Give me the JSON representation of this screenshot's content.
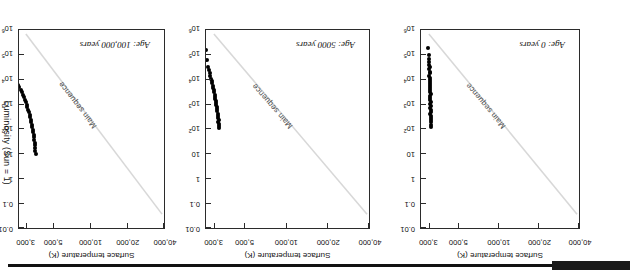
{
  "figure": {
    "kind": "hertzsprung-russell-diagram-series",
    "caption_visible": false,
    "scan_edge_color": "#111111",
    "point_color": "#000000",
    "main_sequence_line_color": "#d8d8d8",
    "frame_color": "#2b2b2b"
  },
  "axes": {
    "temperature": {
      "title": "Surface temperature (K)",
      "ticks": [
        "40,000",
        "20,000",
        "10,000",
        "5,000",
        "3,000"
      ],
      "direction": "decreasing-left-to-right"
    },
    "luminosity": {
      "title": "Luminosity (Sun = 1)",
      "ticks": [
        "0.01",
        "0.1",
        "1",
        "10",
        "10²",
        "10³",
        "10⁴",
        "10⁵",
        "10⁶"
      ],
      "tick_bases": [
        "0.01",
        "0.1",
        "1",
        "10",
        "10",
        "10",
        "10",
        "10",
        "10"
      ],
      "tick_exponents": [
        "",
        "",
        "",
        "",
        "2",
        "3",
        "4",
        "5",
        "6"
      ],
      "direction": "increasing-downward"
    }
  },
  "main_sequence_label": "Main sequence",
  "panels": [
    {
      "id": "panel-0",
      "age_label": "Age: 0 years",
      "order": 1
    },
    {
      "id": "panel-5000",
      "age_label": "Age: 5000 years",
      "order": 2
    },
    {
      "id": "panel-100k",
      "age_label": "Age: 100,000 years",
      "order": 3
    }
  ],
  "chart_data": {
    "type": "scatter",
    "xlabel": "Surface temperature (K)",
    "ylabel": "Luminosity (Sun = 1)",
    "x_ticklabels": [
      "40,000",
      "20,000",
      "10,000",
      "5,000",
      "3,000"
    ],
    "x_tickvalues": [
      40000,
      20000,
      10000,
      5000,
      3000
    ],
    "x_scale": "log-reversed",
    "xlim": [
      40000,
      2600
    ],
    "y_ticklabels": [
      "0.01",
      "0.1",
      "1",
      "10",
      "10^2",
      "10^3",
      "10^4",
      "10^5",
      "10^6"
    ],
    "y_tickvalues": [
      0.01,
      0.1,
      1,
      10,
      100,
      1000,
      10000,
      100000,
      1000000
    ],
    "y_scale": "log",
    "ylim": [
      0.01,
      1000000
    ],
    "grid": false,
    "legend": null,
    "annotations": [
      "Main sequence",
      "Age: 0 years",
      "Age: 5000 years",
      "Age: 100,000 years"
    ],
    "reference_line": {
      "name": "Main sequence",
      "from": {
        "temperature": 40000,
        "luminosity": 0.02
      },
      "to": {
        "temperature": 2900,
        "luminosity": 500000
      }
    },
    "series": [
      {
        "name": "Age: 0 years",
        "panel": "panel-0",
        "points": [
          {
            "temperature": 3100,
            "luminosity": 120
          },
          {
            "temperature": 3100,
            "luminosity": 150
          },
          {
            "temperature": 3080,
            "luminosity": 190
          },
          {
            "temperature": 3090,
            "luminosity": 230
          },
          {
            "temperature": 3070,
            "luminosity": 280
          },
          {
            "temperature": 3100,
            "luminosity": 330
          },
          {
            "temperature": 3060,
            "luminosity": 400
          },
          {
            "temperature": 3080,
            "luminosity": 470
          },
          {
            "temperature": 3090,
            "luminosity": 560
          },
          {
            "temperature": 3050,
            "luminosity": 680
          },
          {
            "temperature": 3070,
            "luminosity": 820
          },
          {
            "temperature": 3060,
            "luminosity": 980
          },
          {
            "temperature": 3080,
            "luminosity": 1200
          },
          {
            "temperature": 3040,
            "luminosity": 1450
          },
          {
            "temperature": 3060,
            "luminosity": 1750
          },
          {
            "temperature": 3050,
            "luminosity": 2100
          },
          {
            "temperature": 3070,
            "luminosity": 2550
          },
          {
            "temperature": 3030,
            "luminosity": 3100
          },
          {
            "temperature": 3050,
            "luminosity": 3750
          },
          {
            "temperature": 3040,
            "luminosity": 4500
          },
          {
            "temperature": 3060,
            "luminosity": 5400
          },
          {
            "temperature": 3020,
            "luminosity": 6600
          },
          {
            "temperature": 3040,
            "luminosity": 8000
          },
          {
            "temperature": 3030,
            "luminosity": 9700
          },
          {
            "temperature": 3050,
            "luminosity": 11800
          },
          {
            "temperature": 3010,
            "luminosity": 14300
          },
          {
            "temperature": 3030,
            "luminosity": 17500
          },
          {
            "temperature": 3020,
            "luminosity": 21000
          },
          {
            "temperature": 3000,
            "luminosity": 26000
          },
          {
            "temperature": 3020,
            "luminosity": 32000
          },
          {
            "temperature": 2990,
            "luminosity": 40000
          },
          {
            "temperature": 3010,
            "luminosity": 50000
          },
          {
            "temperature": 2980,
            "luminosity": 68000
          },
          {
            "temperature": 2990,
            "luminosity": 95000
          },
          {
            "temperature": 2960,
            "luminosity": 190000
          }
        ]
      },
      {
        "name": "Age: 5000 years",
        "panel": "panel-5000",
        "points": [
          {
            "temperature": 3250,
            "luminosity": 105
          },
          {
            "temperature": 3230,
            "luminosity": 130
          },
          {
            "temperature": 3240,
            "luminosity": 160
          },
          {
            "temperature": 3200,
            "luminosity": 195
          },
          {
            "temperature": 3220,
            "luminosity": 235
          },
          {
            "temperature": 3190,
            "luminosity": 285
          },
          {
            "temperature": 3180,
            "luminosity": 345
          },
          {
            "temperature": 3160,
            "luminosity": 420
          },
          {
            "temperature": 3150,
            "luminosity": 510
          },
          {
            "temperature": 3130,
            "luminosity": 620
          },
          {
            "temperature": 3110,
            "luminosity": 750
          },
          {
            "temperature": 3100,
            "luminosity": 900
          },
          {
            "temperature": 3080,
            "luminosity": 1100
          },
          {
            "temperature": 3060,
            "luminosity": 1350
          },
          {
            "temperature": 3040,
            "luminosity": 1650
          },
          {
            "temperature": 3020,
            "luminosity": 2000
          },
          {
            "temperature": 3000,
            "luminosity": 2450
          },
          {
            "temperature": 2980,
            "luminosity": 3000
          },
          {
            "temperature": 2960,
            "luminosity": 3700
          },
          {
            "temperature": 2940,
            "luminosity": 4500
          },
          {
            "temperature": 2910,
            "luminosity": 5600
          },
          {
            "temperature": 2890,
            "luminosity": 6900
          },
          {
            "temperature": 2870,
            "luminosity": 8500
          },
          {
            "temperature": 2850,
            "luminosity": 10500
          },
          {
            "temperature": 2800,
            "luminosity": 14000
          },
          {
            "temperature": 2760,
            "luminosity": 19000
          },
          {
            "temperature": 2730,
            "luminosity": 24000
          },
          {
            "temperature": 2700,
            "luminosity": 33000
          },
          {
            "temperature": 2640,
            "luminosity": 60000
          },
          {
            "temperature": 2580,
            "luminosity": 150000
          }
        ]
      },
      {
        "name": "Age: 100,000 years",
        "panel": "panel-100k",
        "points": [
          {
            "temperature": 3550,
            "luminosity": 10
          },
          {
            "temperature": 3540,
            "luminosity": 13
          },
          {
            "temperature": 3530,
            "luminosity": 17
          },
          {
            "temperature": 3500,
            "luminosity": 22
          },
          {
            "temperature": 3490,
            "luminosity": 28
          },
          {
            "temperature": 3470,
            "luminosity": 36
          },
          {
            "temperature": 3450,
            "luminosity": 46
          },
          {
            "temperature": 3420,
            "luminosity": 58
          },
          {
            "temperature": 3400,
            "luminosity": 74
          },
          {
            "temperature": 3370,
            "luminosity": 94
          },
          {
            "temperature": 3340,
            "luminosity": 120
          },
          {
            "temperature": 3310,
            "luminosity": 150
          },
          {
            "temperature": 3280,
            "luminosity": 190
          },
          {
            "temperature": 3250,
            "luminosity": 240
          },
          {
            "temperature": 3210,
            "luminosity": 300
          },
          {
            "temperature": 3180,
            "luminosity": 380
          },
          {
            "temperature": 3140,
            "luminosity": 480
          },
          {
            "temperature": 3100,
            "luminosity": 600
          },
          {
            "temperature": 3050,
            "luminosity": 760
          },
          {
            "temperature": 3010,
            "luminosity": 950
          },
          {
            "temperature": 2960,
            "luminosity": 1200
          },
          {
            "temperature": 2900,
            "luminosity": 1500
          },
          {
            "temperature": 2850,
            "luminosity": 1900
          },
          {
            "temperature": 2790,
            "luminosity": 2400
          },
          {
            "temperature": 2740,
            "luminosity": 3000
          },
          {
            "temperature": 2680,
            "luminosity": 3800
          },
          {
            "temperature": 2610,
            "luminosity": 4800
          },
          {
            "temperature": 2540,
            "luminosity": 6000
          },
          {
            "temperature": 2460,
            "luminosity": 7600
          },
          {
            "temperature": 2380,
            "luminosity": 9500
          },
          {
            "temperature": 2290,
            "luminosity": 12000
          },
          {
            "temperature": 2190,
            "luminosity": 15000
          },
          {
            "temperature": 2080,
            "luminosity": 19000
          },
          {
            "temperature": 1960,
            "luminosity": 24000
          },
          {
            "temperature": 1830,
            "luminosity": 30000
          }
        ]
      }
    ]
  }
}
